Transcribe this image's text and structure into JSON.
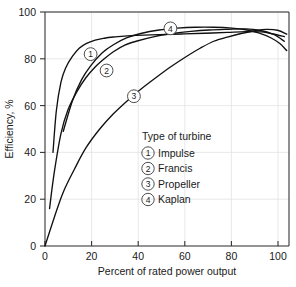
{
  "chart_data": {
    "type": "line",
    "title": "",
    "xlabel": "Percent of rated power output",
    "ylabel": "Efficiency, %",
    "xlim": [
      0,
      107
    ],
    "ylim": [
      0,
      100
    ],
    "xticks": [
      0,
      20,
      40,
      60,
      80,
      100
    ],
    "yticks": [
      0,
      20,
      40,
      60,
      80,
      100
    ],
    "xtick_labels": [
      "0",
      "20",
      "40",
      "60",
      "80",
      "100"
    ],
    "ytick_labels": [
      "0",
      "20",
      "40",
      "60",
      "80",
      "100"
    ],
    "grid": true,
    "legend_position": "center-right-inside",
    "legend_title": "Type of turbine",
    "series": [
      {
        "name": "Impulse",
        "number": "1",
        "marker_label": "1",
        "marker_at": {
          "x": 20,
          "y": 82
        },
        "x": [
          3.5,
          5,
          7,
          9,
          12,
          15,
          18,
          22,
          26,
          30,
          35,
          40,
          50,
          60,
          70,
          80,
          88,
          95,
          100,
          105
        ],
        "y": [
          40,
          58,
          70,
          76,
          81,
          84.5,
          86.5,
          88,
          88.8,
          89.3,
          89.7,
          90,
          90.3,
          90.6,
          90.9,
          91.3,
          91.6,
          91.5,
          90.6,
          89.5
        ]
      },
      {
        "name": "Francis",
        "number": "2",
        "marker_label": "2",
        "marker_at": {
          "x": 27,
          "y": 75
        },
        "x": [
          2,
          4,
          7,
          10,
          14,
          18,
          22,
          26,
          30,
          35,
          40,
          48,
          56,
          64,
          72,
          80,
          88,
          94,
          100,
          105
        ],
        "y": [
          16,
          31,
          48,
          58,
          66,
          72,
          76.5,
          80,
          83,
          85.8,
          87.5,
          89.5,
          90.8,
          91.7,
          92.3,
          92.6,
          92.8,
          92.2,
          90.5,
          87.5
        ]
      },
      {
        "name": "Propeller",
        "number": "3",
        "marker_label": "3",
        "marker_at": {
          "x": 39,
          "y": 64
        },
        "x": [
          0,
          4,
          8,
          13,
          18,
          24,
          30,
          36,
          42,
          48,
          55,
          62,
          68,
          74,
          80,
          86,
          92,
          97,
          102,
          106
        ],
        "y": [
          0,
          12,
          23,
          33,
          42,
          50,
          56.5,
          62,
          67,
          71.5,
          76.5,
          81,
          84.5,
          87.5,
          89.3,
          90.8,
          92,
          92.6,
          92.2,
          90.5
        ]
      },
      {
        "name": "Kaplan",
        "number": "4",
        "marker_label": "4",
        "marker_at": {
          "x": 55,
          "y": 93
        },
        "x": [
          8,
          12,
          16,
          20,
          25,
          30,
          36,
          42,
          50,
          58,
          66,
          74,
          82,
          88,
          94,
          99,
          103,
          106
        ],
        "y": [
          49,
          62,
          71,
          77,
          82.5,
          86,
          89,
          90.8,
          92.3,
          93.1,
          93.5,
          93.5,
          93.1,
          92.4,
          91,
          89,
          86.5,
          83.5
        ]
      }
    ]
  },
  "legend": {
    "title": "Type of turbine",
    "entries": [
      {
        "number": "1",
        "label": "Impulse"
      },
      {
        "number": "2",
        "label": "Francis"
      },
      {
        "number": "3",
        "label": "Propeller"
      },
      {
        "number": "4",
        "label": "Kaplan"
      }
    ]
  },
  "axes": {
    "x_title": "Percent of rated power output",
    "y_title": "Efficiency, %",
    "x_ticks": [
      "0",
      "20",
      "40",
      "60",
      "80",
      "100"
    ],
    "y_ticks": [
      "0",
      "20",
      "40",
      "60",
      "80",
      "100"
    ]
  },
  "colors": {
    "curve": "#111111",
    "axis": "#2b2b2b",
    "grid": "#e2e2e2",
    "text": "#1a1a1a",
    "background": "#ffffff"
  }
}
